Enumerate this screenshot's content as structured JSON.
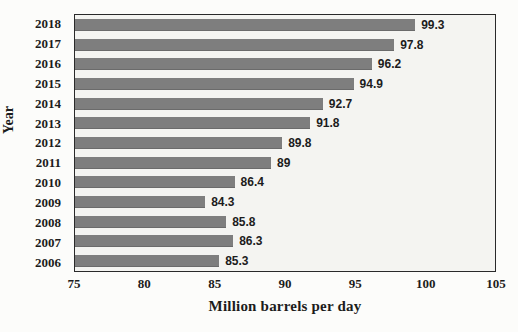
{
  "chart_data": {
    "type": "bar",
    "orientation": "horizontal",
    "title": "",
    "xlabel": "Million barrels per day",
    "ylabel": "Year",
    "categories": [
      "2018",
      "2017",
      "2016",
      "2015",
      "2014",
      "2013",
      "2012",
      "2011",
      "2010",
      "2009",
      "2008",
      "2007",
      "2006"
    ],
    "values": [
      99.3,
      97.8,
      96.2,
      94.9,
      92.7,
      91.8,
      89.8,
      89,
      86.4,
      84.3,
      85.8,
      86.3,
      85.3
    ],
    "value_labels": [
      "99.3",
      "97.8",
      "96.2",
      "94.9",
      "92.7",
      "91.8",
      "89.8",
      "89",
      "86.4",
      "84.3",
      "85.8",
      "86.3",
      "85.3"
    ],
    "xlim": [
      75,
      105
    ],
    "xticks": [
      75,
      80,
      85,
      90,
      95,
      100,
      105
    ],
    "grid": false,
    "legend": "none",
    "bar_color": "#7e7e7e",
    "plot_background": "#f4f4f1",
    "border_color": "#2a2a2a"
  }
}
